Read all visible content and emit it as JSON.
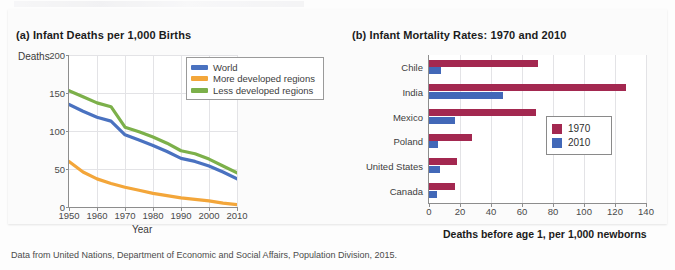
{
  "caption": "Data from United Nations, Department of Economic and Social Affairs, Population Division, 2015.",
  "colors": {
    "world_blue": "#4a72c0",
    "more_developed_orange": "#f3a63a",
    "less_developed_green": "#7cb04a",
    "bar_1970_crimson": "#a32850",
    "bar_2010_blue": "#4268b8",
    "grid": "#e3e3e6",
    "axis": "#8d8d8d"
  },
  "panel_a": {
    "title": "(a) Infant Deaths per 1,000 Births",
    "y_axis_name": "Deaths",
    "x_axis_name": "Year",
    "legend": [
      {
        "label": "World",
        "color": "#4a72c0"
      },
      {
        "label": "More developed regions",
        "color": "#f3a63a"
      },
      {
        "label": "Less developed regions",
        "color": "#7cb04a"
      }
    ]
  },
  "panel_b": {
    "title": "(b) Infant Mortality Rates: 1970 and 2010",
    "x_axis_name": "Deaths before age 1, per 1,000 newborns",
    "legend": [
      {
        "label": "1970",
        "color": "#a32850"
      },
      {
        "label": "2010",
        "color": "#4268b8"
      }
    ]
  },
  "chart_data": [
    {
      "type": "line",
      "title": "(a) Infant Deaths per 1,000 Births",
      "xlabel": "Year",
      "ylabel": "Deaths",
      "xlim": [
        1950,
        2010
      ],
      "ylim": [
        0,
        200
      ],
      "xticks": [
        1950,
        1960,
        1970,
        1980,
        1990,
        2000,
        2010
      ],
      "yticks": [
        0,
        50,
        100,
        150,
        200
      ],
      "grid": true,
      "legend_position": "top-right",
      "x": [
        1950,
        1955,
        1960,
        1965,
        1970,
        1975,
        1980,
        1985,
        1990,
        1995,
        2000,
        2005,
        2010
      ],
      "series": [
        {
          "name": "World",
          "color": "#4a72c0",
          "values": [
            135,
            126,
            118,
            113,
            95,
            88,
            81,
            73,
            64,
            60,
            54,
            46,
            37
          ]
        },
        {
          "name": "More developed regions",
          "color": "#f3a63a",
          "values": [
            60,
            46,
            37,
            31,
            26,
            22,
            18,
            15,
            12,
            10,
            8,
            5,
            3
          ]
        },
        {
          "name": "Less developed regions",
          "color": "#7cb04a",
          "values": [
            153,
            145,
            137,
            132,
            105,
            99,
            92,
            84,
            74,
            70,
            63,
            54,
            45
          ]
        }
      ]
    },
    {
      "type": "bar",
      "orientation": "horizontal",
      "title": "(b) Infant Mortality Rates: 1970 and 2010",
      "xlabel": "Deaths before age 1, per 1,000 newborns",
      "ylabel": "",
      "xlim": [
        0,
        140
      ],
      "xticks": [
        0,
        20,
        40,
        60,
        80,
        100,
        120,
        140
      ],
      "grid": true,
      "legend_position": "right",
      "categories": [
        "Chile",
        "India",
        "Mexico",
        "Poland",
        "United States",
        "Canada"
      ],
      "series": [
        {
          "name": "1970",
          "color": "#a32850",
          "values": [
            70,
            127,
            69,
            28,
            18,
            17
          ]
        },
        {
          "name": "2010",
          "color": "#4268b8",
          "values": [
            8,
            48,
            17,
            6,
            7,
            5
          ]
        }
      ]
    }
  ]
}
